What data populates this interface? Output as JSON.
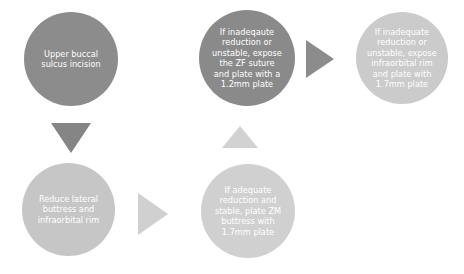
{
  "diagram": {
    "type": "flowchart",
    "nodes": [
      {
        "id": "n1",
        "label": "Upper buccal sulcus incision",
        "lines": [
          "Upper buccal",
          "sulcus incision"
        ],
        "color": "#8c8c8c"
      },
      {
        "id": "n2",
        "label": "Reduce lateral buttress and infraorbital rim",
        "lines": [
          "Reduce lateral",
          "buttress and",
          "infraorbital rim"
        ],
        "color": "#c6c6c6"
      },
      {
        "id": "n3",
        "label": "If adequate reduction and stable, plate ZM buttress with 1.7mm plate",
        "lines": [
          "If adequate",
          "reduction and",
          "stable, plate ZM",
          "buttress with",
          "1.7mm plate"
        ],
        "color": "#d0d0d0"
      },
      {
        "id": "n4",
        "label": "If inadeqaute reduction or unstable, expose the ZF suture and plate with a 1.2mm plate",
        "lines": [
          "If inadeqaute",
          "reduction or",
          "unstable, expose",
          "the ZF suture",
          "and plate with a",
          "1.2mm plate"
        ],
        "color": "#8a8a8a"
      },
      {
        "id": "n5",
        "label": "If inadequate reduction or unstable, expose infraorbital rim and plate with 1.7mm plate",
        "lines": [
          "If inadequate",
          "reduction or",
          "unstable, expose",
          "infraorbital rim",
          "and plate with",
          "1.7mm plate"
        ],
        "color": "#cbcbcb"
      }
    ],
    "arrows": [
      {
        "from": "n1",
        "to": "n2",
        "direction": "down",
        "color": "#858585"
      },
      {
        "from": "n2",
        "to": "n3",
        "direction": "right",
        "color": "#d0d0d0"
      },
      {
        "from": "n3",
        "to": "n4",
        "direction": "up",
        "color": "#d2d2d2"
      },
      {
        "from": "n4",
        "to": "n5",
        "direction": "right",
        "color": "#8c8c8c"
      }
    ]
  }
}
